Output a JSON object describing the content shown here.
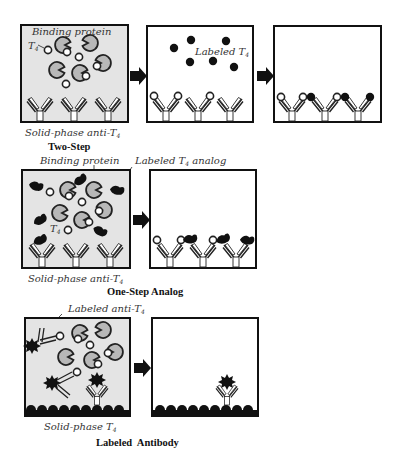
{
  "figure": {
    "colors": {
      "panel_fill_reaction": "#e4e4e4",
      "panel_fill_wash": "#ffffff",
      "outline": "#111111",
      "binding_protein": "#b8b8b8",
      "label_dark": "#111111",
      "t4_free": "#ffffff"
    },
    "rows": [
      {
        "title": "Two-Step",
        "panel1_labels": {
          "binding_protein": "Binding protein",
          "t4": "T",
          "t4_sub": "4",
          "solid_phase": "Solid-phase anti-T",
          "solid_phase_sub": "4"
        },
        "panel2_labels": {
          "labeled": "Labeled T",
          "labeled_sub": "4"
        }
      },
      {
        "title": "One-Step Analog",
        "panel1_labels": {
          "binding_protein": "Binding protein",
          "labeled_analog": "Labeled T",
          "labeled_analog_sub": "4",
          "labeled_analog_suffix": " analog",
          "t4": "T",
          "t4_sub": "4",
          "solid_phase": "Solid-phase anti-T",
          "solid_phase_sub": "4"
        }
      },
      {
        "title": "Labeled  Antibody",
        "panel1_labels": {
          "labeled_anti": "Labeled  anti-T",
          "labeled_anti_sub": "4",
          "solid_phase": "Solid-phase T",
          "solid_phase_sub": "4"
        }
      }
    ],
    "icons": [
      "antibody-icon",
      "binding-protein-icon",
      "t4-molecule-icon",
      "labeled-t4-icon",
      "labeled-analog-icon",
      "labeled-antibody-icon",
      "arrow-right-icon"
    ]
  }
}
